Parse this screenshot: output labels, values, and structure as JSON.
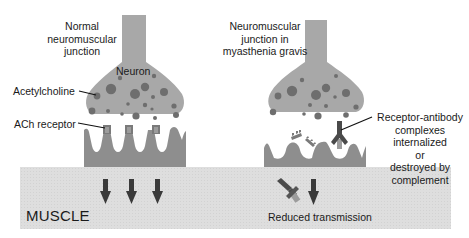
{
  "diagram": {
    "left_panel": {
      "title_lines": [
        "Normal",
        "neuromuscular",
        "junction"
      ],
      "neuron_label": "Neuron",
      "acetylcholine_label": "Acetylcholine",
      "ach_receptor_label": "ACh receptor",
      "signal_arrows": 3
    },
    "right_panel": {
      "title_lines": [
        "Neuromuscular",
        "junction in",
        "myasthenia gravis"
      ],
      "annotation_lines": [
        "Receptor-antibody",
        "complexes",
        "internalized",
        "or",
        "destroyed by",
        "complement"
      ],
      "transmission_label": "Reduced transmission",
      "signal_arrows": 1
    },
    "muscle_label": "MUSCLE",
    "colors": {
      "neuron": "#a8a8a8",
      "vesicle": "#6e6e6e",
      "postsynaptic": "#8e8e8e",
      "receptor": "#7a7a7a",
      "muscle": "#dcdcdc",
      "arrow": "#3a3a3a",
      "antibody": "#4a4a4a"
    }
  }
}
